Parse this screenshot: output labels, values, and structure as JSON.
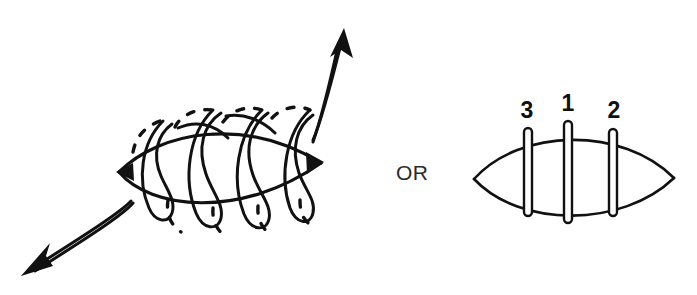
{
  "figure": {
    "background_color": "#ffffff",
    "ink_color": "#111111",
    "connector": {
      "label": "OR",
      "x": 396,
      "y": 180
    },
    "left_panel": {
      "name": "continuous-helical-suture",
      "description": "Lens shaped wound closed with a continuous spiral (helical) running suture, drawn with dashed segments where the thread passes behind the tissue",
      "lens": {
        "left_tip_x": 118,
        "right_tip_x": 322,
        "center_y": 170,
        "half_height": 40
      },
      "coil_turns": 5,
      "arrows": [
        {
          "name": "suture-exit-arrow-upper-right",
          "direction": "up-right",
          "from_x": 312,
          "from_y": 142,
          "to_x": 344,
          "to_y": 30
        },
        {
          "name": "suture-entry-arrow-lower-left",
          "direction": "down-left",
          "from_x": 131,
          "from_y": 201,
          "to_x": 23,
          "to_y": 274
        }
      ]
    },
    "right_panel": {
      "name": "interrupted-suture-order",
      "description": "Lens shaped wound closed with three interrupted sutures placed in the numbered order",
      "lens": {
        "left_tip_x": 472,
        "right_tip_x": 676,
        "center_y": 178,
        "half_height": 48
      },
      "sutures": [
        {
          "label": "3",
          "x": 528,
          "top_y": 128,
          "bottom_y": 216,
          "label_x": 527,
          "label_y": 118
        },
        {
          "label": "1",
          "x": 568,
          "top_y": 121,
          "bottom_y": 223,
          "label_x": 568,
          "label_y": 111
        },
        {
          "label": "2",
          "x": 613,
          "top_y": 129,
          "bottom_y": 216,
          "label_x": 614,
          "label_y": 118
        }
      ]
    }
  }
}
